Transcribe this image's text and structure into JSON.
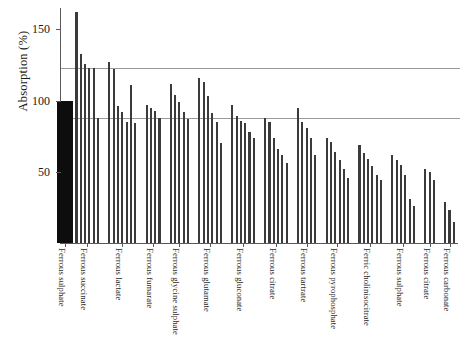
{
  "chart_data": {
    "type": "bar",
    "title": "",
    "subtitle": "",
    "xlabel": "",
    "ylabel": "Absorption (%)",
    "ylim": [
      0,
      165
    ],
    "yticks": [
      50,
      100,
      150
    ],
    "ytick_labels": [
      "50",
      "100",
      "150"
    ],
    "grid": false,
    "legend_position": "none",
    "reference_lines": [
      {
        "name": "upper-reference-line",
        "value": 123
      },
      {
        "name": "lower-reference-line",
        "value": 88
      }
    ],
    "annotations": [
      "Reference compound Ferrous sulphate set at 100% absorption (filled black bar)"
    ],
    "groups": [
      {
        "label": "Ferrous sulphate",
        "values": [
          100
        ],
        "reference": true
      },
      {
        "label": "Ferrous succinate",
        "values": [
          162,
          133,
          126,
          123,
          123,
          88
        ]
      },
      {
        "label": "Ferrous lactate",
        "values": [
          127,
          122,
          96,
          92,
          85,
          111,
          84
        ]
      },
      {
        "label": "Ferrous fumarate",
        "values": [
          97,
          95,
          93,
          88
        ]
      },
      {
        "label": "Ferrous glycine sulphate",
        "values": [
          112,
          104,
          99,
          92,
          87
        ]
      },
      {
        "label": "Ferrous glutamate",
        "values": [
          116,
          113,
          103,
          91,
          85,
          70
        ]
      },
      {
        "label": "Ferrous gluconate",
        "values": [
          97,
          89,
          86,
          84,
          78,
          74
        ]
      },
      {
        "label": "Ferrous citrate",
        "values": [
          88,
          85,
          74,
          66,
          62,
          56
        ]
      },
      {
        "label": "Ferrous tartrate",
        "values": [
          95,
          85,
          81,
          74,
          62
        ]
      },
      {
        "label": "Ferrous pyrophosphate",
        "values": [
          74,
          71,
          64,
          58,
          52,
          46
        ]
      },
      {
        "label": "Ferric cholinisocitrate",
        "values": [
          69,
          63,
          59,
          54,
          48,
          44
        ]
      },
      {
        "label": "Ferrous sulphate",
        "values": [
          62,
          58,
          55,
          48,
          31,
          26
        ]
      },
      {
        "label": "Ferrous citrate",
        "values": [
          52,
          50,
          44
        ]
      },
      {
        "label": "Ferrous carbonate",
        "values": [
          29,
          23,
          15
        ]
      }
    ]
  }
}
